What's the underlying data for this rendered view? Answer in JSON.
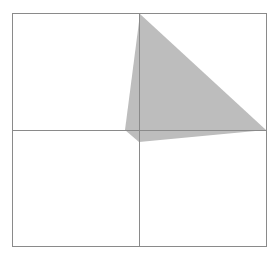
{
  "diagram": {
    "title": "",
    "frame": {
      "x": 12,
      "y": 13,
      "width": 254,
      "height": 233,
      "stroke": "#8a8a8a"
    },
    "grid_lines": {
      "vertical_x": 139,
      "horizontal_y": 130,
      "stroke": "#8a8a8a"
    },
    "shape": {
      "type": "polygon",
      "fill": "#bdbdbd",
      "points": [
        [
          140,
          14
        ],
        [
          125,
          130
        ],
        [
          139,
          142
        ],
        [
          266,
          130
        ]
      ]
    }
  }
}
